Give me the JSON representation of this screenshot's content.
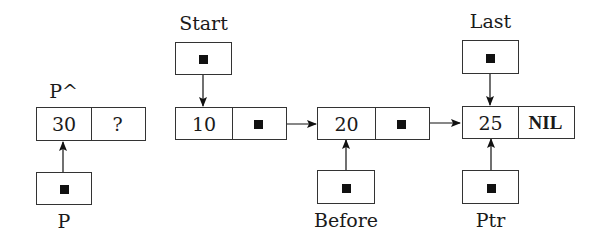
{
  "diagram": {
    "type": "linked-list",
    "nodes": [
      {
        "id": "p-node",
        "caption": "P^",
        "value": "30",
        "next": "?"
      },
      {
        "id": "node-10",
        "value": "10",
        "next": "pointer"
      },
      {
        "id": "node-20",
        "value": "20",
        "next": "pointer"
      },
      {
        "id": "node-25",
        "value": "25",
        "next": "NIL"
      }
    ],
    "pointers": [
      {
        "id": "p",
        "label": "P",
        "target": "p-node"
      },
      {
        "id": "start",
        "label": "Start",
        "target": "node-10"
      },
      {
        "id": "before",
        "label": "Before",
        "target": "node-20"
      },
      {
        "id": "last",
        "label": "Last",
        "target": "node-25"
      },
      {
        "id": "ptr",
        "label": "Ptr",
        "target": "node-25"
      }
    ]
  }
}
